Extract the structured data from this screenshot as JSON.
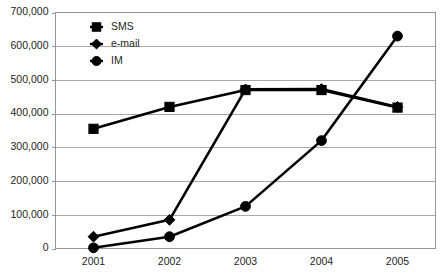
{
  "chart_data": {
    "type": "line",
    "title": "",
    "xlabel": "",
    "ylabel": "",
    "categories": [
      "2001",
      "2002",
      "2003",
      "2004",
      "2005"
    ],
    "x": [
      2001,
      2002,
      2003,
      2004,
      2005
    ],
    "ylim": [
      0,
      700000
    ],
    "yticks": [
      0,
      100000,
      200000,
      300000,
      400000,
      500000,
      600000,
      700000
    ],
    "ytick_labels": [
      "0",
      "100,000",
      "200,000",
      "300,000",
      "400,000",
      "500,000",
      "600,000",
      "700,000"
    ],
    "xtick_labels": [
      "2001",
      "2002",
      "2003",
      "2004",
      "2005"
    ],
    "grid": "horizontal",
    "legend_position": "upper-left-inside",
    "series": [
      {
        "name": "SMS",
        "marker": "square",
        "color": "#000000",
        "values": [
          355000,
          420000,
          470000,
          470000,
          418000
        ]
      },
      {
        "name": "e-mail",
        "marker": "diamond",
        "color": "#000000",
        "values": [
          35000,
          85000,
          472000,
          473000,
          420000
        ]
      },
      {
        "name": "IM",
        "marker": "circle",
        "color": "#000000",
        "values": [
          2000,
          35000,
          125000,
          320000,
          630000
        ]
      }
    ]
  },
  "axis": {
    "y_labels": [
      "700,000",
      "600,000",
      "500,000",
      "400,000",
      "300,000",
      "200,000",
      "100,000",
      "0"
    ],
    "x_labels": [
      "2001",
      "2002",
      "2003",
      "2004",
      "2005"
    ]
  },
  "legend": {
    "items": [
      {
        "label": "SMS",
        "marker": "square-marker-icon"
      },
      {
        "label": "e-mail",
        "marker": "diamond-marker-icon"
      },
      {
        "label": "IM",
        "marker": "circle-marker-icon"
      }
    ]
  },
  "colors": {
    "series": "#000000",
    "gridline": "#a7a9ac",
    "frame": "#939598",
    "text": "#231f20",
    "background": "#ffffff"
  }
}
